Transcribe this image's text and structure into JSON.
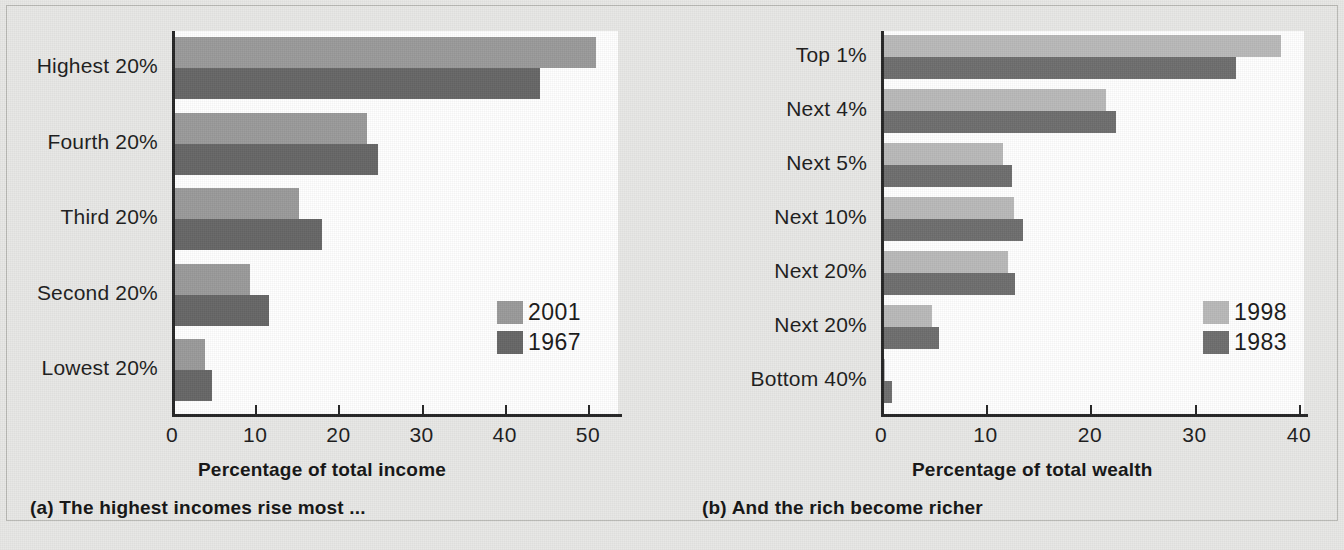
{
  "figure": {
    "background_color": "#e8e8e6",
    "plot_background": "#ffffff",
    "axis_color": "#262626"
  },
  "panel_a": {
    "caption": "(a) The highest incomes rise most ...",
    "axis_title": "Percentage of total income",
    "legend": [
      {
        "label": "2001",
        "color": "#9a9a9a"
      },
      {
        "label": "1967",
        "color": "#666666"
      }
    ],
    "tick_labels": [
      "0",
      "10",
      "20",
      "30",
      "40",
      "50"
    ],
    "categories": [
      "Highest 20%",
      "Fourth 20%",
      "Third 20%",
      "Second 20%",
      "Lowest 20%"
    ]
  },
  "panel_b": {
    "caption": "(b) And the rich become richer",
    "axis_title": "Percentage of total wealth",
    "legend": [
      {
        "label": "1998",
        "color": "#b9b9b9"
      },
      {
        "label": "1983",
        "color": "#6e6e6e"
      }
    ],
    "tick_labels": [
      "0",
      "10",
      "20",
      "30",
      "40"
    ],
    "categories": [
      "Top 1%",
      "Next 4%",
      "Next 5%",
      "Next 10%",
      "Next 20%",
      "Next 20%",
      "Bottom 40%"
    ]
  },
  "chart_data": [
    {
      "type": "bar",
      "orientation": "horizontal",
      "title": "(a) The highest incomes rise most ...",
      "xlabel": "Percentage of total income",
      "ylabel": "",
      "xlim": [
        0,
        52
      ],
      "xticks": [
        0,
        10,
        20,
        30,
        40,
        50
      ],
      "grid": false,
      "legend_position": "inside-right-lower",
      "categories": [
        "Highest 20%",
        "Fourth 20%",
        "Third 20%",
        "Second 20%",
        "Lowest 20%"
      ],
      "series": [
        {
          "name": "2001",
          "color": "#9a9a9a",
          "values": [
            50.7,
            23.2,
            15.0,
            9.1,
            3.7
          ]
        },
        {
          "name": "1967",
          "color": "#666666",
          "values": [
            44.0,
            24.5,
            17.8,
            11.4,
            4.6
          ]
        }
      ]
    },
    {
      "type": "bar",
      "orientation": "horizontal",
      "title": "(b) And the rich become richer",
      "xlabel": "Percentage of total wealth",
      "ylabel": "",
      "xlim": [
        0,
        42
      ],
      "xticks": [
        0,
        10,
        20,
        30,
        40
      ],
      "grid": false,
      "legend_position": "inside-right-lower",
      "categories": [
        "Top 1%",
        "Next 4%",
        "Next 5%",
        "Next 10%",
        "Next 20%",
        "Next 20%",
        "Bottom 40%"
      ],
      "series": [
        {
          "name": "1998",
          "color": "#b9b9b9",
          "values": [
            38.1,
            21.3,
            11.5,
            12.5,
            12.0,
            4.7,
            0.2
          ]
        },
        {
          "name": "1983",
          "color": "#6e6e6e",
          "values": [
            33.8,
            22.3,
            12.3,
            13.4,
            12.6,
            5.4,
            0.9
          ]
        }
      ]
    }
  ]
}
